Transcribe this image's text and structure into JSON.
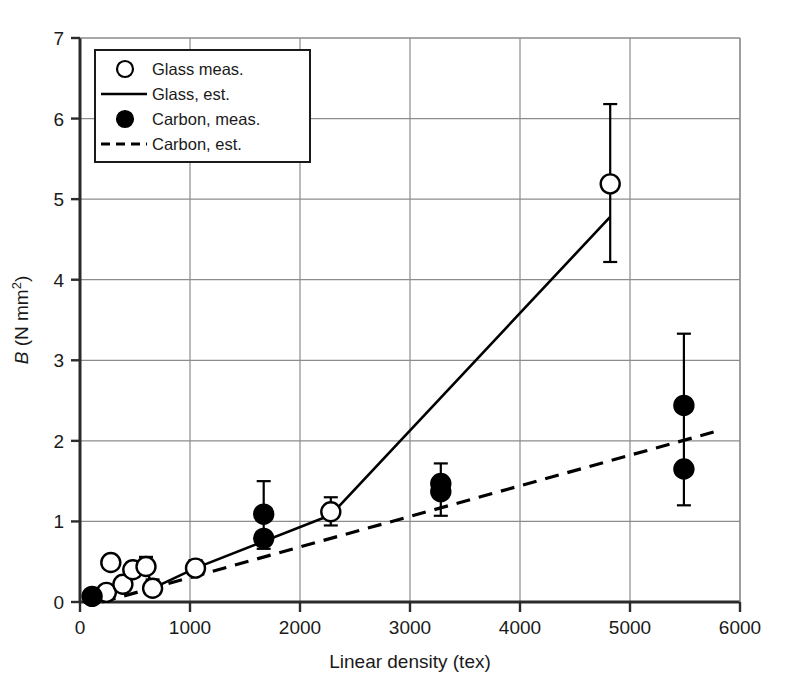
{
  "chart_data": {
    "type": "scatter",
    "title": "",
    "xlabel": "Linear density (tex)",
    "ylabel": "B (N mm2)",
    "ylabel_parts": {
      "symbol": "B",
      "units_pre": " (N mm",
      "units_sup": "2",
      "units_post": ")"
    },
    "xlim": [
      0,
      6000
    ],
    "ylim": [
      0,
      7
    ],
    "xticks": [
      0,
      1000,
      2000,
      3000,
      4000,
      5000,
      6000
    ],
    "xtick_labels": [
      "0",
      "1000",
      "2000",
      "3000",
      "4000",
      "5000",
      "6000"
    ],
    "yticks": [
      0,
      1,
      2,
      3,
      4,
      5,
      6,
      7
    ],
    "ytick_labels": [
      "0",
      "1",
      "2",
      "3",
      "4",
      "5",
      "6",
      "7"
    ],
    "grid": "both",
    "legend_position": "upper-left-inset",
    "legend": [
      {
        "label": "Glass meas.",
        "marker": "open-circle",
        "style": "marker"
      },
      {
        "label": "Glass, est.",
        "marker": "solid-line",
        "style": "line"
      },
      {
        "label": "Carbon, meas.",
        "marker": "filled-circle",
        "style": "marker"
      },
      {
        "label": "Carbon, est.",
        "marker": "dashed-line",
        "style": "line"
      }
    ],
    "series": [
      {
        "name": "Glass meas.",
        "marker": "open-circle",
        "points": [
          {
            "x": 240,
            "y": 0.12,
            "yerr_low": null,
            "yerr_high": null
          },
          {
            "x": 280,
            "y": 0.49,
            "yerr_low": null,
            "yerr_high": null
          },
          {
            "x": 390,
            "y": 0.22,
            "yerr_low": 0.14,
            "yerr_high": 0.3
          },
          {
            "x": 480,
            "y": 0.4,
            "yerr_low": 0.31,
            "yerr_high": 0.49
          },
          {
            "x": 600,
            "y": 0.44,
            "yerr_low": 0.38,
            "yerr_high": 0.56
          },
          {
            "x": 660,
            "y": 0.17,
            "yerr_low": 0.11,
            "yerr_high": 0.28
          },
          {
            "x": 1050,
            "y": 0.42,
            "yerr_low": 0.34,
            "yerr_high": 0.52
          },
          {
            "x": 2280,
            "y": 1.12,
            "yerr_low": 0.95,
            "yerr_high": 1.3
          },
          {
            "x": 4820,
            "y": 5.19,
            "yerr_low": 4.22,
            "yerr_high": 6.18
          }
        ]
      },
      {
        "name": "Carbon, meas.",
        "marker": "filled-circle",
        "points": [
          {
            "x": 110,
            "y": 0.07,
            "yerr_low": null,
            "yerr_high": null
          },
          {
            "x": 1670,
            "y": 1.09,
            "yerr_low": 0.66,
            "yerr_high": 1.5
          },
          {
            "x": 1670,
            "y": 0.79,
            "yerr_low": null,
            "yerr_high": null
          },
          {
            "x": 3280,
            "y": 1.47,
            "yerr_low": 1.07,
            "yerr_high": 1.72
          },
          {
            "x": 3280,
            "y": 1.37,
            "yerr_low": null,
            "yerr_high": null
          },
          {
            "x": 5490,
            "y": 2.44,
            "yerr_low": 1.2,
            "yerr_high": 3.33
          },
          {
            "x": 5490,
            "y": 1.65,
            "yerr_low": null,
            "yerr_high": null
          }
        ]
      },
      {
        "name": "Glass, est.",
        "style": "solid-line",
        "points": [
          {
            "x": 110,
            "y": 0.0
          },
          {
            "x": 280,
            "y": 0.12
          },
          {
            "x": 390,
            "y": 0.22
          },
          {
            "x": 480,
            "y": 0.4
          },
          {
            "x": 600,
            "y": 0.44
          },
          {
            "x": 660,
            "y": 0.17
          },
          {
            "x": 1050,
            "y": 0.42
          },
          {
            "x": 2280,
            "y": 1.08
          },
          {
            "x": 4820,
            "y": 4.78
          }
        ]
      },
      {
        "name": "Carbon, est.",
        "style": "dashed-line",
        "points": [
          {
            "x": 200,
            "y": 0.0
          },
          {
            "x": 5760,
            "y": 2.11
          }
        ]
      }
    ]
  }
}
